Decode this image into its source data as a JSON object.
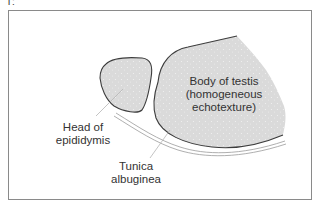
{
  "figure": {
    "number_glyph": "T:",
    "colors": {
      "frame": "#8a8a8a",
      "tissue_fill": "#dadada",
      "outline": "#3c3c3c",
      "tunica_lines": "#9a9a9a",
      "leader_lines": "#b5b5b5",
      "text": "#333333"
    }
  },
  "labels": {
    "body_of_testis": {
      "line1": "Body of testis",
      "line2": "(homogeneous",
      "line3": "echotexture)"
    },
    "head_of_epididymis": {
      "line1": "Head of",
      "line2": "epididymis"
    },
    "tunica_albuginea": {
      "line1": "Tunica",
      "line2": "albuginea"
    }
  }
}
